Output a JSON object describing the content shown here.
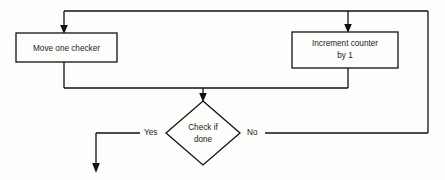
{
  "diagram": {
    "type": "flowchart",
    "canvas": {
      "width": 445,
      "height": 180,
      "background": "#fdfdfb"
    },
    "stroke_color": "#111111",
    "text_color": "#1a1a1a",
    "nodes": [
      {
        "id": "move-checker",
        "kind": "process",
        "shape": "rectangle",
        "label_line1": "Move one checker",
        "x": 16,
        "y": 33,
        "width": 101,
        "height": 29
      },
      {
        "id": "increment-counter",
        "kind": "process",
        "shape": "rectangle",
        "label_line1": "Increment counter",
        "label_line2": "by 1",
        "x": 292,
        "y": 32,
        "width": 106,
        "height": 36
      },
      {
        "id": "check-if-done",
        "kind": "decision",
        "shape": "diamond",
        "label_line1": "Check if",
        "label_line2": "done",
        "cx": 203,
        "cy": 133,
        "half_width": 37,
        "half_height": 32
      }
    ],
    "edges": [
      {
        "id": "loop-top-to-move",
        "from": "loop-bus",
        "to": "move-checker",
        "label": "",
        "arrow": true
      },
      {
        "id": "loop-top-to-increment",
        "from": "loop-bus",
        "to": "increment-counter",
        "label": "",
        "arrow": true
      },
      {
        "id": "move-to-decision",
        "from": "move-checker",
        "to": "check-if-done",
        "label": "",
        "arrow": true
      },
      {
        "id": "increment-to-decision",
        "from": "increment-counter",
        "to": "check-if-done",
        "label": "",
        "arrow": false
      },
      {
        "id": "decision-yes-exit",
        "from": "check-if-done",
        "to": "exit",
        "label": "Yes",
        "arrow": true
      },
      {
        "id": "decision-no-loop",
        "from": "check-if-done",
        "to": "loop-bus",
        "label": "No",
        "arrow": false
      }
    ],
    "labels": {
      "yes": "Yes",
      "no": "No"
    }
  }
}
